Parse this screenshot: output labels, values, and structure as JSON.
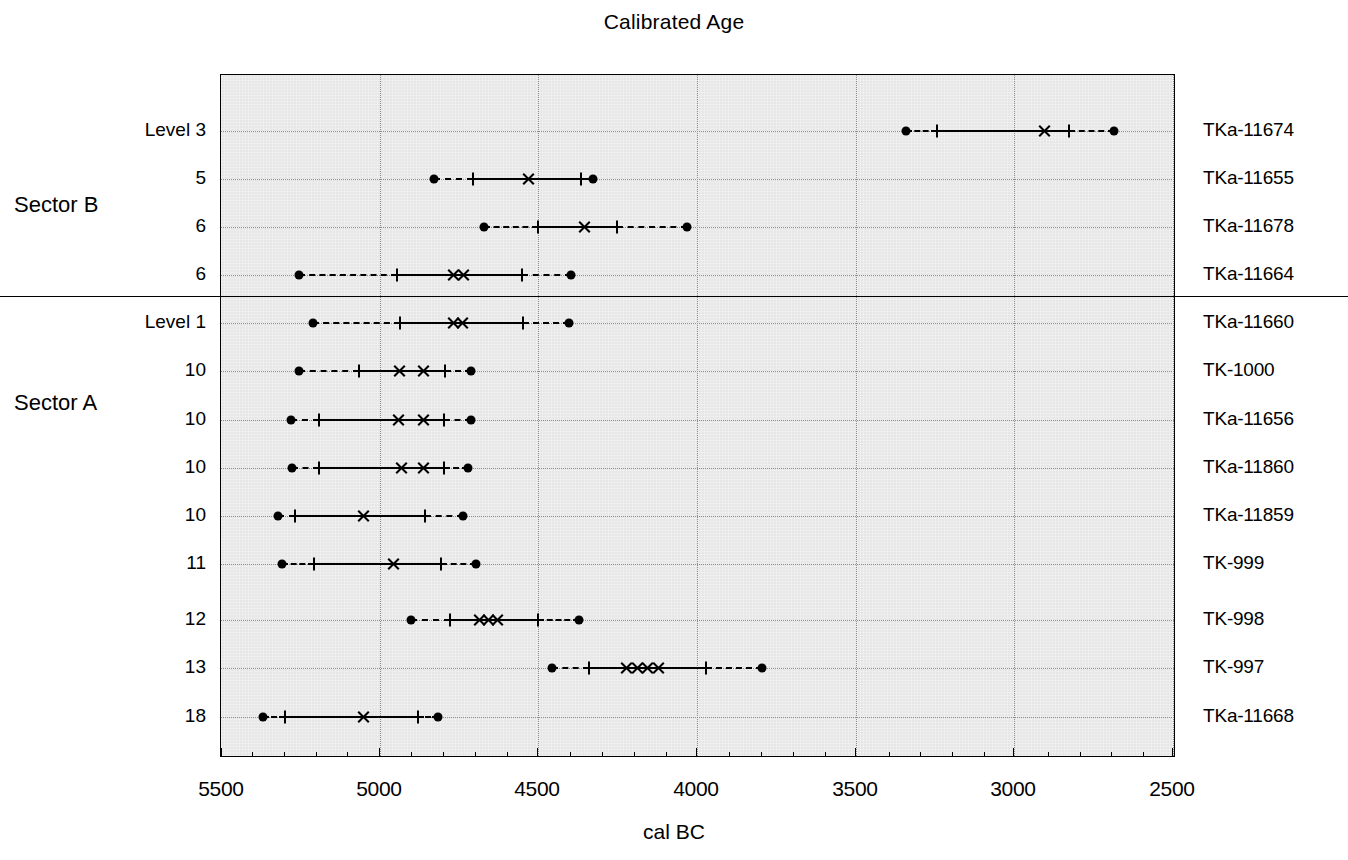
{
  "chart_data": {
    "type": "range",
    "title": "Calibrated Age",
    "xlabel": "cal BC",
    "ylabel": "",
    "xlim": [
      5500,
      2500
    ],
    "x_reversed": true,
    "grid": true,
    "legend": "none",
    "xticks": [
      5500,
      5000,
      4500,
      4000,
      3500,
      3000,
      2500
    ],
    "xtick_labels": [
      "5500",
      "5000",
      "4500",
      "4000",
      "3500",
      "3000",
      "2500"
    ],
    "x_minor_tick_step": 100,
    "sectors": [
      {
        "name": "Sector B",
        "rows": [
          0,
          1,
          2,
          3
        ]
      },
      {
        "name": "Sector A",
        "rows": [
          4,
          5,
          6,
          7,
          8,
          9,
          10,
          11,
          12
        ]
      }
    ],
    "rows": [
      {
        "level_label": "Level  3",
        "lab_code": "TKa-11674",
        "range_2sigma": [
          3660,
          3150
        ],
        "range_1sigma": [
          3565,
          3295
        ],
        "medians": [
          3375
        ]
      },
      {
        "level_label": "5",
        "lab_code": "TKa-11655",
        "range_2sigma": [
          4830,
          4330
        ],
        "range_1sigma": [
          4705,
          4365
        ],
        "medians": [
          4530
        ]
      },
      {
        "level_label": "6",
        "lab_code": "TKa-11678",
        "range_2sigma": [
          4670,
          4030
        ],
        "range_1sigma": [
          4500,
          4250
        ],
        "medians": [
          4355
        ]
      },
      {
        "level_label": "6",
        "lab_code": "TKa-11664",
        "range_2sigma": [
          5245,
          4390
        ],
        "range_1sigma": [
          4935,
          4545
        ],
        "medians": [
          4760,
          4730
        ]
      },
      {
        "level_label": "Level  1",
        "lab_code": "TKa-11660",
        "range_2sigma": [
          5200,
          4395
        ],
        "range_1sigma": [
          4925,
          4540
        ],
        "medians": [
          4760,
          4735
        ]
      },
      {
        "level_label": "10",
        "lab_code": "TK-1000",
        "range_2sigma": [
          5245,
          4700
        ],
        "range_1sigma": [
          5055,
          4785
        ],
        "medians": [
          4925,
          4850
        ]
      },
      {
        "level_label": "10",
        "lab_code": "TKa-11656",
        "range_2sigma": [
          5275,
          4700
        ],
        "range_1sigma": [
          5190,
          4790
        ],
        "medians": [
          4930,
          4850
        ]
      },
      {
        "level_label": "10",
        "lab_code": "TKa-11860",
        "range_2sigma": [
          5270,
          4710
        ],
        "range_1sigma": [
          5190,
          4790
        ],
        "medians": [
          4920,
          4850
        ]
      },
      {
        "level_label": "10",
        "lab_code": "TKa-11859",
        "range_2sigma": [
          5320,
          4725
        ],
        "range_1sigma": [
          5265,
          4855
        ],
        "medians": [
          5045
        ]
      },
      {
        "level_label": "11",
        "lab_code": "TK-999",
        "range_2sigma": [
          5305,
          4705
        ],
        "range_1sigma": [
          5205,
          4805
        ],
        "medians": [
          4950
        ]
      },
      {
        "level_label": "12",
        "lab_code": "TK-998",
        "range_2sigma": [
          4900,
          4370
        ],
        "range_1sigma": [
          4775,
          4495
        ],
        "medians": [
          4685,
          4660,
          4630
        ]
      },
      {
        "level_label": "13",
        "lab_code": "TK-997",
        "range_2sigma": [
          4455,
          3790
        ],
        "range_1sigma": [
          4340,
          3970
        ],
        "medians": [
          4225,
          4195,
          4160,
          4120
        ]
      },
      {
        "level_label": "18",
        "lab_code": "TKa-11668",
        "range_2sigma": [
          5365,
          4810
        ],
        "range_1sigma": [
          5295,
          4875
        ],
        "medians": [
          5045
        ]
      }
    ]
  },
  "geometry": {
    "plot_left": 220,
    "plot_top": 74,
    "plot_width": 955,
    "plot_height": 683,
    "row_y": [
      130,
      178,
      226,
      274,
      322,
      370,
      419,
      467,
      515,
      563,
      619,
      667,
      716
    ],
    "px": [
      {
        "dot_a": 905,
        "tick_a": 936,
        "marks": [
          1043
        ],
        "tick_b": 1068,
        "dot_b": 1113
      },
      {
        "dot_a": 433,
        "tick_a": 472,
        "marks": [
          527
        ],
        "tick_b": 580,
        "dot_b": 592
      },
      {
        "dot_a": 483,
        "tick_a": 537,
        "marks": [
          583
        ],
        "tick_b": 616,
        "dot_b": 686
      },
      {
        "dot_a": 298,
        "tick_a": 396,
        "marks": [
          452,
          462
        ],
        "tick_b": 521,
        "dot_b": 570
      },
      {
        "dot_a": 312,
        "tick_a": 399,
        "marks": [
          452,
          461
        ],
        "tick_b": 522,
        "dot_b": 568
      },
      {
        "dot_a": 298,
        "tick_a": 358,
        "marks": [
          398,
          422
        ],
        "tick_b": 444,
        "dot_b": 470
      },
      {
        "dot_a": 290,
        "tick_a": 318,
        "marks": [
          397,
          422
        ],
        "tick_b": 443,
        "dot_b": 470
      },
      {
        "dot_a": 291,
        "tick_a": 318,
        "marks": [
          400,
          422
        ],
        "tick_b": 443,
        "dot_b": 467
      },
      {
        "dot_a": 277,
        "tick_a": 294,
        "marks": [
          362
        ],
        "tick_b": 424,
        "dot_b": 462
      },
      {
        "dot_a": 281,
        "tick_a": 313,
        "marks": [
          392
        ],
        "tick_b": 440,
        "dot_b": 475
      },
      {
        "dot_a": 410,
        "tick_a": 449,
        "marks": [
          478,
          487,
          496
        ],
        "tick_b": 537,
        "dot_b": 578
      },
      {
        "dot_a": 551,
        "tick_a": 588,
        "marks": [
          625,
          636,
          646,
          657
        ],
        "tick_b": 705,
        "dot_b": 761
      },
      {
        "dot_a": 262,
        "tick_a": 284,
        "marks": [
          362
        ],
        "tick_b": 417,
        "dot_b": 437
      }
    ],
    "xtick_px": [
      221,
      379,
      537,
      696,
      855,
      1013,
      1172
    ],
    "sector_divider_y": 296,
    "sector_label_y": [
      205,
      403
    ]
  },
  "colors": {
    "panel": "#e6e6e6",
    "ink": "#000000",
    "grid": "#8d8d8d",
    "background": "#ffffff"
  }
}
